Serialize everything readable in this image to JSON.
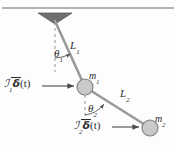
{
  "figure": {
    "colors": {
      "ceiling_line": "#999999",
      "pivot_triangle": "#6e6e6e",
      "rod": "#9a9a9a",
      "mass_fill": "#c9c9c9",
      "mass_stroke": "#808080",
      "dashed_reference": "#8a8a8a",
      "arrow": "#4a4a4a",
      "text": "#2b2b2b",
      "background": "#fdfdfd"
    },
    "labels": {
      "length_1": {
        "symbol": "L",
        "subscript": "1"
      },
      "length_2": {
        "symbol": "L",
        "subscript": "2"
      },
      "mass_1": {
        "symbol": "m",
        "subscript": "1"
      },
      "mass_2": {
        "symbol": "m",
        "subscript": "2"
      },
      "angle_1": {
        "symbol": "θ",
        "subscript": "1"
      },
      "angle_2": {
        "symbol": "θ",
        "subscript": "2"
      },
      "impulse_1": {
        "symbol": "ℐ",
        "subscript": "1",
        "delta": "δ",
        "argument": "(t)"
      },
      "impulse_2": {
        "symbol": "ℐ",
        "subscript": "2",
        "delta": "δ",
        "argument": "(t)"
      }
    },
    "geometry": {
      "ceiling_y": 8,
      "pivot": {
        "x": 55,
        "y": 21
      },
      "mass_1_center": {
        "x": 85,
        "y": 87
      },
      "mass_2_center": {
        "x": 150,
        "y": 128
      },
      "mass_1_radius": 8,
      "mass_2_radius": 8,
      "force_arrow_1": {
        "x1": 42,
        "y1": 85,
        "x2": 75,
        "y2": 86
      },
      "force_arrow_2": {
        "x1": 112,
        "y1": 127,
        "x2": 140,
        "y2": 127
      }
    }
  }
}
